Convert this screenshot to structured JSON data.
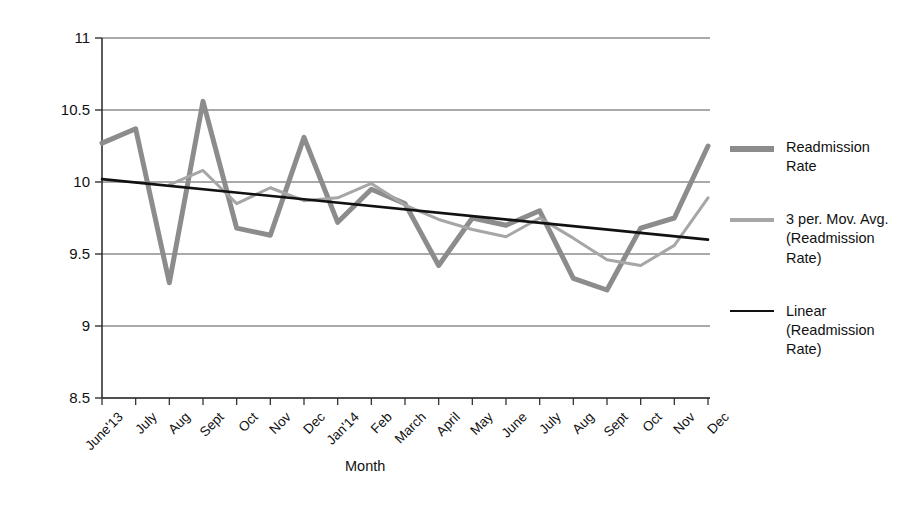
{
  "chart_data": {
    "type": "line",
    "title": "",
    "xlabel": "Month",
    "ylabel": "",
    "ylim": [
      8.5,
      11
    ],
    "ytick_step": 0.5,
    "yticks": [
      "11",
      "10.5",
      "10",
      "9.5",
      "9",
      "8.5"
    ],
    "grid": true,
    "legend_position": "right",
    "categories": [
      "June'13",
      "July",
      "Aug",
      "Sept",
      "Oct",
      "Nov",
      "Dec",
      "Jan'14",
      "Feb",
      "March",
      "April",
      "May",
      "June",
      "July",
      "Aug",
      "Sept",
      "Oct",
      "Nov",
      "Dec"
    ],
    "series": [
      {
        "name": "Readmission Rate",
        "color": "#8c8c8c",
        "width": 5,
        "values": [
          10.27,
          10.37,
          9.3,
          10.56,
          9.68,
          9.63,
          10.31,
          9.72,
          9.95,
          9.85,
          9.42,
          9.75,
          9.7,
          9.8,
          9.33,
          9.25,
          9.68,
          9.75,
          10.25
        ]
      },
      {
        "name": "3 per. Mov. Avg. (Readmission Rate)",
        "color": "#a6a6a6",
        "width": 3,
        "values": [
          null,
          null,
          9.98,
          10.08,
          9.85,
          9.96,
          9.87,
          9.89,
          9.99,
          9.84,
          9.74,
          9.67,
          9.62,
          9.75,
          9.61,
          9.46,
          9.42,
          9.56,
          9.89
        ]
      },
      {
        "name": "Linear (Readmission Rate)",
        "color": "#111111",
        "width": 2.6,
        "trend": true,
        "start_value": 10.02,
        "end_value": 9.6
      }
    ]
  },
  "legend": {
    "items": [
      {
        "label": "Readmission Rate",
        "color": "#8c8c8c",
        "thickness": 6
      },
      {
        "label": "3 per. Mov. Avg. (Readmission Rate)",
        "color": "#a6a6a6",
        "thickness": 4
      },
      {
        "label": "Linear (Readmission Rate)",
        "color": "#111111",
        "thickness": 2
      }
    ]
  },
  "axis": {
    "x_title": "Month"
  }
}
